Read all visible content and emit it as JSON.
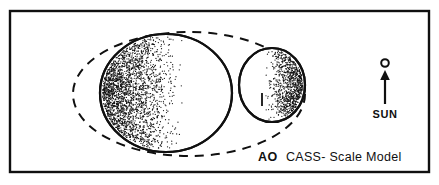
{
  "figure": {
    "title": "AO CASS- Scale Model",
    "background_color": "#ffffff",
    "ink_color": "#101010",
    "frame": {
      "name": "figure-border",
      "x": 10,
      "y": 11,
      "width": 419,
      "height": 161,
      "stroke_width": 2.4
    }
  },
  "caption": {
    "prefix": "AO",
    "text": "CASS- Scale Model",
    "x_prefix": 258,
    "x_text": 286,
    "y": 161
  },
  "sun_indicator": {
    "label": "SUN",
    "label_x": 385,
    "label_y": 118,
    "symbol": "sun-circle",
    "circle_cx": 385,
    "circle_cy": 63,
    "circle_r": 3.8,
    "arrow_x": 385,
    "arrow_tail_y": 104,
    "arrow_head_y": 72
  },
  "bodies": [
    {
      "name": "envelope-dashed-ellipse",
      "role": "outer envelope / orbit outline",
      "style": "dashed",
      "cx": 189,
      "cy": 94,
      "rx": 116,
      "ry": 62,
      "stroke_width": 2.0,
      "dash": "9 7"
    },
    {
      "name": "primary-body-circle",
      "role": "primary star (large sphere)",
      "style": "solid",
      "cx": 166,
      "cy": 93,
      "rx": 66,
      "ry": 59,
      "stroke_width": 2.2,
      "shading": "stipple-crescent-left",
      "illuminated_from": "right"
    },
    {
      "name": "secondary-body-ellipse",
      "role": "secondary companion (smaller lobe)",
      "style": "solid",
      "cx": 272,
      "cy": 85,
      "rx": 33,
      "ry": 37,
      "stroke_width": 2.2,
      "shading": "stipple-crescent-right",
      "illuminated_from": "left"
    }
  ],
  "marks": [
    {
      "name": "terminator-tick",
      "x1": 262,
      "y1": 93,
      "x2": 262,
      "y2": 106
    }
  ],
  "stipple": {
    "primary_seed": 7,
    "primary_count": 2300,
    "secondary_seed": 19,
    "secondary_count": 900,
    "dot_radius": 0.62
  }
}
